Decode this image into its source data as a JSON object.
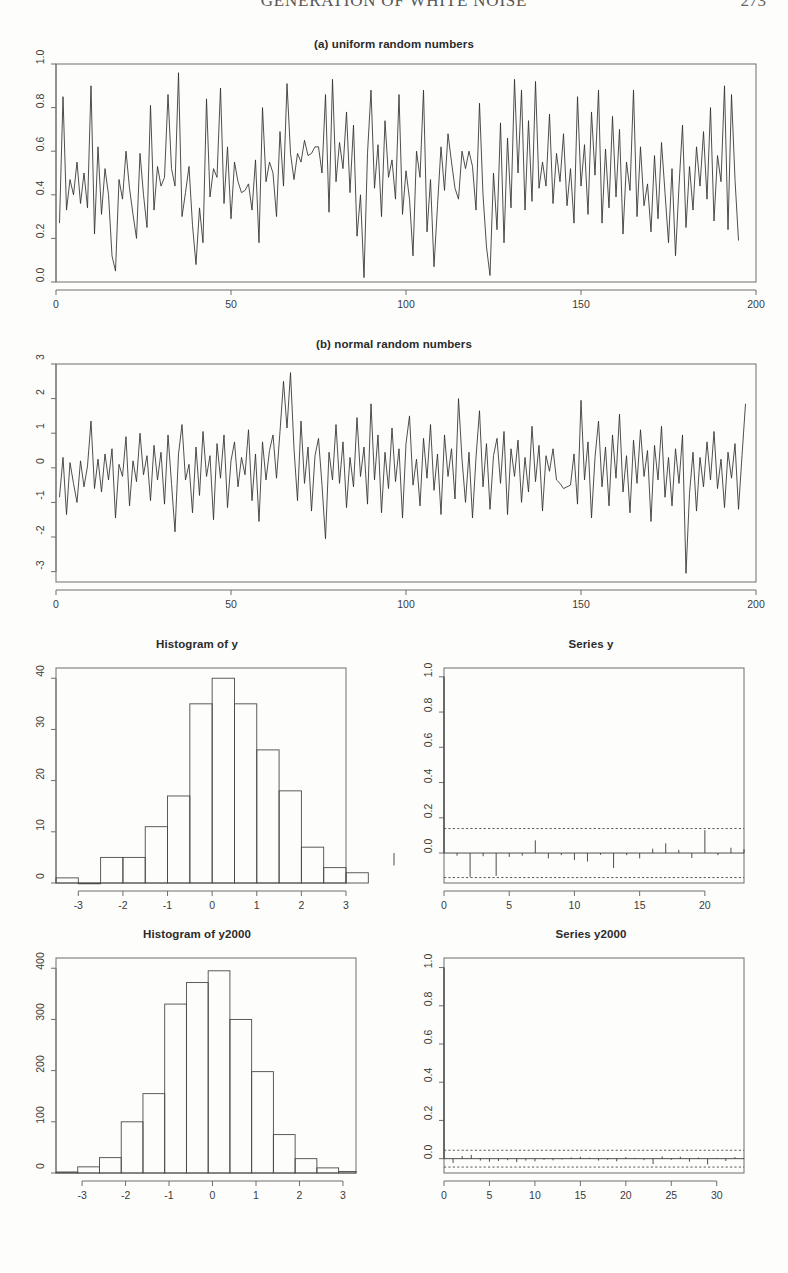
{
  "header": {
    "running_title": "GENERATION OF WHITE NOISE",
    "page_number": "273"
  },
  "panels": {
    "uniform": {
      "title": "(a) uniform random numbers"
    },
    "normal": {
      "title": "(b) normal random numbers"
    },
    "hist_y": {
      "title": "Histogram of y"
    },
    "acf_y": {
      "title": "Series  y"
    },
    "hist_y2000": {
      "title": "Histogram of y2000"
    },
    "acf_y2000": {
      "title": "Series  y2000"
    }
  },
  "chart_data": [
    {
      "id": "uniform-timeseries",
      "type": "line",
      "title": "(a) uniform random numbers",
      "xlabel": "",
      "ylabel": "",
      "xlim": [
        0,
        200
      ],
      "ylim": [
        0.0,
        1.0
      ],
      "xticks": [
        0,
        50,
        100,
        150,
        200
      ],
      "xticklabels": [
        "0",
        "50",
        "100",
        "150",
        "200"
      ],
      "yticks": [
        0.0,
        0.2,
        0.4,
        0.6,
        0.8,
        1.0
      ],
      "yticklabels": [
        "0.0",
        "0.2",
        "0.4",
        "0.6",
        "0.8",
        "1.0"
      ],
      "grid": false,
      "legend": "none",
      "x": [
        1,
        2,
        3,
        4,
        5,
        6,
        7,
        8,
        9,
        10,
        11,
        12,
        13,
        14,
        15,
        16,
        17,
        18,
        19,
        20,
        21,
        22,
        23,
        24,
        25,
        26,
        27,
        28,
        29,
        30,
        31,
        32,
        33,
        34,
        35,
        36,
        37,
        38,
        39,
        40,
        41,
        42,
        43,
        44,
        45,
        46,
        47,
        48,
        49,
        50,
        51,
        52,
        53,
        54,
        55,
        56,
        57,
        58,
        59,
        60,
        61,
        62,
        63,
        64,
        65,
        66,
        67,
        68,
        69,
        70,
        71,
        72,
        73,
        74,
        75,
        76,
        77,
        78,
        79,
        80,
        81,
        82,
        83,
        84,
        85,
        86,
        87,
        88,
        89,
        90,
        91,
        92,
        93,
        94,
        95,
        96,
        97,
        98,
        99,
        100,
        101,
        102,
        103,
        104,
        105,
        106,
        107,
        108,
        109,
        110,
        111,
        112,
        113,
        114,
        115,
        116,
        117,
        118,
        119,
        120,
        121,
        122,
        123,
        124,
        125,
        126,
        127,
        128,
        129,
        130,
        131,
        132,
        133,
        134,
        135,
        136,
        137,
        138,
        139,
        140,
        141,
        142,
        143,
        144,
        145,
        146,
        147,
        148,
        149,
        150,
        151,
        152,
        153,
        154,
        155,
        156,
        157,
        158,
        159,
        160,
        161,
        162,
        163,
        164,
        165,
        166,
        167,
        168,
        169,
        170,
        171,
        172,
        173,
        174,
        175,
        176,
        177,
        178,
        179,
        180,
        181,
        182,
        183,
        184,
        185,
        186,
        187,
        188,
        189,
        190,
        191,
        192,
        193,
        194,
        195,
        196,
        197,
        198,
        199,
        200
      ],
      "values": [
        0.27,
        0.85,
        0.33,
        0.47,
        0.4,
        0.55,
        0.36,
        0.5,
        0.34,
        0.9,
        0.22,
        0.62,
        0.31,
        0.52,
        0.4,
        0.12,
        0.05,
        0.47,
        0.38,
        0.6,
        0.43,
        0.31,
        0.2,
        0.59,
        0.4,
        0.25,
        0.81,
        0.33,
        0.53,
        0.44,
        0.48,
        0.86,
        0.52,
        0.44,
        0.96,
        0.3,
        0.41,
        0.53,
        0.26,
        0.08,
        0.34,
        0.18,
        0.84,
        0.39,
        0.52,
        0.48,
        0.89,
        0.36,
        0.62,
        0.29,
        0.55,
        0.46,
        0.41,
        0.42,
        0.45,
        0.33,
        0.56,
        0.18,
        0.8,
        0.46,
        0.55,
        0.5,
        0.3,
        0.69,
        0.44,
        0.91,
        0.59,
        0.47,
        0.59,
        0.55,
        0.65,
        0.58,
        0.59,
        0.62,
        0.62,
        0.5,
        0.86,
        0.32,
        0.93,
        0.46,
        0.64,
        0.52,
        0.78,
        0.41,
        0.72,
        0.21,
        0.4,
        0.02,
        0.59,
        0.88,
        0.43,
        0.63,
        0.3,
        0.74,
        0.48,
        0.56,
        0.38,
        0.86,
        0.31,
        0.51,
        0.38,
        0.12,
        0.6,
        0.48,
        0.88,
        0.23,
        0.47,
        0.07,
        0.35,
        0.62,
        0.42,
        0.68,
        0.55,
        0.43,
        0.38,
        0.6,
        0.52,
        0.6,
        0.53,
        0.33,
        0.82,
        0.4,
        0.16,
        0.03,
        0.5,
        0.24,
        0.73,
        0.18,
        0.66,
        0.34,
        0.93,
        0.5,
        0.88,
        0.33,
        0.74,
        0.37,
        0.92,
        0.43,
        0.55,
        0.44,
        0.77,
        0.36,
        0.59,
        0.46,
        0.68,
        0.35,
        0.52,
        0.27,
        0.85,
        0.44,
        0.63,
        0.31,
        0.78,
        0.49,
        0.88,
        0.27,
        0.61,
        0.34,
        0.76,
        0.39,
        0.7,
        0.22,
        0.55,
        0.42,
        0.88,
        0.3,
        0.62,
        0.35,
        0.45,
        0.23,
        0.58,
        0.29,
        0.64,
        0.41,
        0.18,
        0.52,
        0.12,
        0.44,
        0.72,
        0.25,
        0.53,
        0.33,
        0.62,
        0.44,
        0.69,
        0.38,
        0.8,
        0.28,
        0.58,
        0.46,
        0.9,
        0.24,
        0.86,
        0.47,
        0.19
      ]
    },
    {
      "id": "normal-timeseries",
      "type": "line",
      "title": "(b) normal random numbers",
      "xlabel": "",
      "ylabel": "",
      "xlim": [
        0,
        200
      ],
      "ylim": [
        -3.3,
        3.0
      ],
      "xticks": [
        0,
        50,
        100,
        150,
        200
      ],
      "xticklabels": [
        "0",
        "50",
        "100",
        "150",
        "200"
      ],
      "yticks": [
        -3,
        -2,
        -1,
        0,
        1,
        2,
        3
      ],
      "yticklabels": [
        "-3",
        "-2",
        "-1",
        "0",
        "1",
        "2",
        "3"
      ],
      "grid": false,
      "legend": "none",
      "values": [
        -0.85,
        0.3,
        -1.35,
        0.15,
        -0.45,
        -1.0,
        0.2,
        -0.55,
        0.05,
        1.35,
        -0.6,
        0.25,
        -0.7,
        0.4,
        -0.35,
        0.55,
        -1.45,
        0.1,
        -0.25,
        0.9,
        -1.1,
        0.2,
        -0.4,
        1.0,
        -0.2,
        0.35,
        -0.95,
        0.65,
        -0.35,
        0.45,
        -1.05,
        0.95,
        -0.45,
        -1.85,
        0.4,
        1.25,
        -0.35,
        0.1,
        -1.3,
        0.6,
        -0.8,
        1.05,
        -0.25,
        0.35,
        -1.5,
        0.7,
        -0.3,
        0.95,
        -1.15,
        0.2,
        0.75,
        -0.55,
        0.3,
        -0.2,
        1.1,
        -0.95,
        0.4,
        -1.55,
        0.75,
        -0.35,
        0.5,
        0.95,
        -0.3,
        1.05,
        2.5,
        1.15,
        2.75,
        0.55,
        -0.95,
        1.35,
        -0.45,
        0.6,
        -1.25,
        0.35,
        0.85,
        -0.5,
        -2.05,
        0.45,
        -0.35,
        1.25,
        -0.45,
        0.75,
        -1.15,
        0.3,
        -0.55,
        1.45,
        -0.25,
        0.6,
        -1.05,
        1.85,
        -0.35,
        0.95,
        -1.3,
        0.45,
        -0.6,
        1.15,
        -0.4,
        0.55,
        -1.45,
        0.7,
        1.5,
        -0.5,
        0.25,
        -1.1,
        0.85,
        -0.3,
        1.25,
        -0.65,
        0.4,
        -1.35,
        0.95,
        -0.25,
        0.55,
        -0.9,
        2.0,
        0.25,
        -1.0,
        0.45,
        -1.45,
        0.3,
        1.65,
        -0.55,
        0.7,
        -1.2,
        0.35,
        0.85,
        -0.45,
        1.05,
        -1.35,
        0.55,
        -0.25,
        0.8,
        -1.0,
        0.3,
        -0.7,
        1.2,
        -0.4,
        0.65,
        -1.25,
        0.35,
        -0.1,
        0.55,
        -0.35,
        -0.45,
        -0.6,
        -0.55,
        -0.5,
        0.4,
        -1.05,
        1.95,
        -0.35,
        0.75,
        -1.45,
        0.3,
        1.35,
        -0.55,
        0.6,
        -1.1,
        0.95,
        -0.3,
        1.55,
        -0.7,
        0.35,
        -1.3,
        0.8,
        -0.45,
        1.1,
        -0.25,
        0.5,
        -1.55,
        0.65,
        -0.35,
        1.2,
        -0.85,
        0.3,
        -1.1,
        0.55,
        -0.45,
        0.95,
        -3.05,
        -0.75,
        0.45,
        -1.25,
        0.3,
        -0.55,
        0.75,
        -0.35,
        1.05,
        -0.6,
        0.25,
        -1.15,
        0.45,
        -0.3,
        0.7,
        -1.2,
        0.35,
        1.85
      ]
    },
    {
      "id": "hist-y",
      "type": "bar",
      "title": "Histogram of y",
      "xlabel": "",
      "ylabel": "",
      "xlim": [
        -3.5,
        3.0
      ],
      "ylim": [
        0,
        42
      ],
      "xticks": [
        -3,
        -2,
        -1,
        0,
        1,
        2,
        3
      ],
      "xticklabels": [
        "-3",
        "-2",
        "-1",
        "0",
        "1",
        "2",
        "3"
      ],
      "yticks": [
        0,
        10,
        20,
        30,
        40
      ],
      "yticklabels": [
        "0",
        "10",
        "20",
        "30",
        "40"
      ],
      "bin_edges": [
        -3.5,
        -3.0,
        -2.5,
        -2.0,
        -1.5,
        -1.0,
        -0.5,
        0.0,
        0.5,
        1.0,
        1.5,
        2.0,
        2.5,
        3.0
      ],
      "categories": [
        "-3.5..-3.0",
        "-3.0..-2.5",
        "-2.5..-2.0",
        "-2.0..-1.5",
        "-1.5..-1.0",
        "-1.0..-0.5",
        "-0.5..0.0",
        "0.0..0.5",
        "0.5..1.0",
        "1.0..1.5",
        "1.5..2.0",
        "2.0..2.5",
        "2.5..3.0"
      ],
      "values": [
        1,
        0,
        5,
        5,
        11,
        17,
        35,
        40,
        35,
        26,
        18,
        7,
        3,
        2
      ],
      "grid": false,
      "legend": "none"
    },
    {
      "id": "acf-y",
      "type": "bar",
      "title": "Series  y",
      "xlabel": "",
      "ylabel": "",
      "xlim": [
        0,
        23
      ],
      "ylim": [
        -0.17,
        1.05
      ],
      "xticks": [
        0,
        5,
        10,
        15,
        20
      ],
      "xticklabels": [
        "0",
        "5",
        "10",
        "15",
        "20"
      ],
      "yticks": [
        0.0,
        0.2,
        0.4,
        0.6,
        0.8,
        1.0
      ],
      "yticklabels": [
        "0.0",
        "0.2",
        "0.4",
        "0.6",
        "0.8",
        "1.0"
      ],
      "confidence_band": [
        -0.139,
        0.139
      ],
      "categories": [
        0,
        1,
        2,
        3,
        4,
        5,
        6,
        7,
        8,
        9,
        10,
        11,
        12,
        13,
        14,
        15,
        16,
        17,
        18,
        19,
        20,
        21,
        22,
        23
      ],
      "values": [
        1.0,
        -0.015,
        -0.135,
        -0.018,
        -0.13,
        -0.022,
        -0.015,
        0.072,
        -0.03,
        -0.012,
        -0.04,
        -0.048,
        -0.01,
        -0.085,
        -0.012,
        -0.03,
        0.025,
        0.055,
        0.018,
        -0.028,
        0.13,
        -0.012,
        0.03,
        0.022,
        -0.07
      ],
      "grid": false,
      "legend": "none"
    },
    {
      "id": "hist-y2000",
      "type": "bar",
      "title": "Histogram of y2000",
      "xlabel": "",
      "ylabel": "",
      "xlim": [
        -3.6,
        3.3
      ],
      "ylim": [
        0,
        420
      ],
      "xticks": [
        -3,
        -2,
        -1,
        0,
        1,
        2,
        3
      ],
      "xticklabels": [
        "-3",
        "-2",
        "-1",
        "0",
        "1",
        "2",
        "3"
      ],
      "yticks": [
        0,
        100,
        200,
        300,
        400
      ],
      "yticklabels": [
        "0",
        "100",
        "200",
        "300",
        "400"
      ],
      "bin_edges": [
        -3.6,
        -3.1,
        -2.6,
        -2.1,
        -1.6,
        -1.1,
        -0.6,
        -0.1,
        0.4,
        0.9,
        1.4,
        1.9,
        2.4,
        2.9,
        3.3
      ],
      "categories": [
        "-3.6..-3.1",
        "-3.1..-2.6",
        "-2.6..-2.1",
        "-2.1..-1.6",
        "-1.6..-1.1",
        "-1.1..-0.6",
        "-0.6..-0.1",
        "-0.1..0.4",
        "0.4..0.9",
        "0.9..1.4",
        "1.4..1.9",
        "1.9..2.4",
        "2.4..2.9",
        "2.9..3.3"
      ],
      "values": [
        2,
        12,
        30,
        100,
        155,
        330,
        372,
        395,
        300,
        198,
        75,
        28,
        10,
        3
      ],
      "grid": false,
      "legend": "none"
    },
    {
      "id": "acf-y2000",
      "type": "bar",
      "title": "Series  y2000",
      "xlabel": "",
      "ylabel": "",
      "xlim": [
        0,
        33
      ],
      "ylim": [
        -0.075,
        1.05
      ],
      "xticks": [
        0,
        5,
        10,
        15,
        20,
        25,
        30
      ],
      "xticklabels": [
        "0",
        "5",
        "10",
        "15",
        "20",
        "25",
        "30"
      ],
      "yticks": [
        0.0,
        0.2,
        0.4,
        0.6,
        0.8,
        1.0
      ],
      "yticklabels": [
        "0.0",
        "0.2",
        "0.4",
        "0.6",
        "0.8",
        "1.0"
      ],
      "confidence_band": [
        -0.044,
        0.044
      ],
      "categories": [
        0,
        1,
        2,
        3,
        4,
        5,
        6,
        7,
        8,
        9,
        10,
        11,
        12,
        13,
        14,
        15,
        16,
        17,
        18,
        19,
        20,
        21,
        22,
        23,
        24,
        25,
        26,
        27,
        28,
        29,
        30,
        31,
        32,
        33
      ],
      "values": [
        1.0,
        -0.022,
        0.014,
        0.02,
        -0.01,
        -0.016,
        -0.012,
        -0.008,
        -0.018,
        -0.01,
        -0.014,
        -0.006,
        -0.009,
        -0.004,
        0.006,
        0.01,
        0.005,
        -0.01,
        -0.006,
        -0.014,
        0.008,
        0.004,
        -0.008,
        -0.028,
        0.012,
        -0.006,
        0.01,
        -0.016,
        0.006,
        -0.03,
        0.004,
        -0.012,
        0.008,
        0.002
      ],
      "grid": false,
      "legend": "none"
    }
  ]
}
